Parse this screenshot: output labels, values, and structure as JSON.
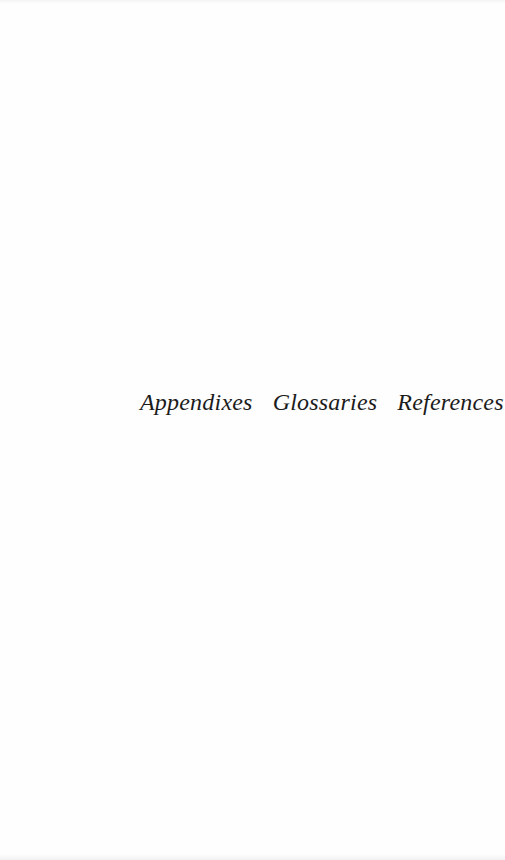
{
  "page": {
    "words": [
      "Appendixes",
      "Glossaries",
      "References"
    ],
    "text_color": "#1c1c1c",
    "background_color": "#fefefe"
  }
}
